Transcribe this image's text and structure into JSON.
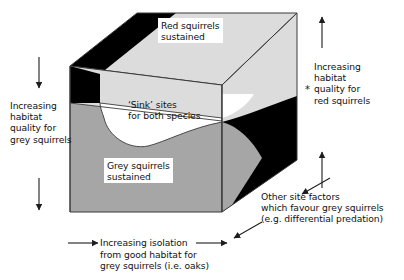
{
  "figure": {
    "type": "conceptual-3d-cube-diagram",
    "title_text": "",
    "background": "#ffffff"
  },
  "colors": {
    "light_grey": "#d9d9d9",
    "top_face_grey": "#dcdcdc",
    "mid_grey": "#a6a6a6",
    "black": "#000000",
    "white": "#ffffff",
    "outline": "#3a3a3a",
    "text": "#111111"
  },
  "regions": {
    "red_sustained": {
      "label": "Red squirrels\nsustained",
      "name": "red-squirrels-sustained-region",
      "fill": "#dcdcdc"
    },
    "sink_sites": {
      "label": "‘Sink’ sites\nfor both species",
      "name": "sink-sites-region",
      "fill": "#ffffff"
    },
    "grey_sustained": {
      "label": "Grey squirrels\nsustained",
      "name": "grey-squirrels-sustained-region",
      "fill": "#a6a6a6"
    },
    "other_factors_black": {
      "label": "",
      "name": "black-wedge-region",
      "fill": "#000000"
    }
  },
  "axes": {
    "left": {
      "label": "Increasing\nhabitat\nquality for\ngrey squirrels",
      "arrow_direction": "down",
      "arrow_count": 2
    },
    "right": {
      "label": "Increasing\nhabitat\nquality for\nred squirrels",
      "arrow_direction": "up",
      "arrow_count": 2,
      "marker": "*"
    },
    "bottom": {
      "label_line1": "Increasing isolation",
      "label_rest": "from good habitat for\ngrey squirrels (i.e. oaks)",
      "arrow_direction": "right",
      "arrow_count": 2
    },
    "depth": {
      "label": "Other site factors\nwhich favour grey squirrels\n(e.g. differential predation)",
      "arrow_direction": "diagonal-down-left",
      "arrow_count": 2
    }
  }
}
